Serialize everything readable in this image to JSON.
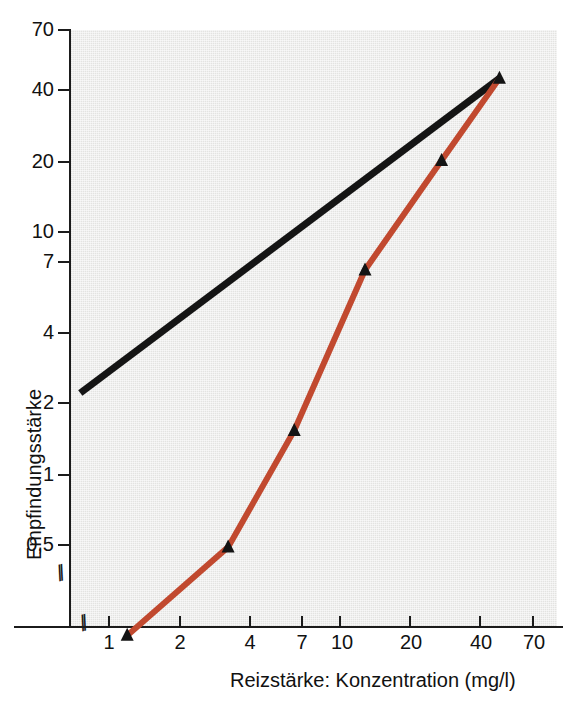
{
  "chart_data": {
    "type": "line",
    "title": "",
    "subtitle": "",
    "xlabel": "Reizstärke: Konzentration (mg/l)",
    "ylabel": "Empfindungsstärke",
    "xscale": "log",
    "yscale": "log",
    "xlim": [
      0.72,
      95
    ],
    "ylim": [
      0.28,
      78
    ],
    "grid": false,
    "legend": null,
    "x_ticks": [
      1,
      2,
      4,
      7,
      10,
      20,
      40,
      70
    ],
    "x_tick_labels": [
      "1",
      "2",
      "4",
      "7",
      "10",
      "20",
      "40",
      "70"
    ],
    "y_ticks": [
      0.5,
      1,
      2,
      4,
      7,
      10,
      20,
      40,
      70
    ],
    "y_tick_labels": [
      "0,5",
      "1",
      "2",
      "4",
      "7",
      "10",
      "20",
      "40",
      "70"
    ],
    "axis_breaks": {
      "x": true,
      "y": true,
      "symbol": "//"
    },
    "series": [
      {
        "name": "Messwerte",
        "color": "#c1492f",
        "marker": "triangle-up",
        "marker_color": "#141414",
        "line_width": 6,
        "x": [
          1.2,
          3.3,
          6.4,
          13.0,
          28.0,
          50.0
        ],
        "y": [
          0.21,
          0.49,
          1.5,
          7.0,
          20.0,
          44.0
        ]
      },
      {
        "name": "Referenzgerade",
        "color": "#141414",
        "marker": "none",
        "line_width": 7,
        "x": [
          0.75,
          50.0
        ],
        "y": [
          2.15,
          44.0
        ]
      }
    ],
    "annotations": []
  },
  "axes": {
    "y_label": "Empfindungsstärke",
    "x_label": "Reizstärke: Konzentration (mg/l)",
    "y_tick_labels": [
      "70",
      "40",
      "20",
      "10",
      "7",
      "4",
      "2",
      "1",
      "0,5"
    ],
    "x_tick_labels": [
      "1",
      "2",
      "4",
      "7",
      "10",
      "20",
      "40",
      "70"
    ],
    "break_symbol": "//"
  },
  "colors": {
    "plot_background": "#e3e3e1",
    "page_background": "#ffffff",
    "data_line": "#c1492f",
    "reference_line": "#141414",
    "marker": "#141414",
    "axis": "#1b1b1b",
    "text": "#111111"
  }
}
